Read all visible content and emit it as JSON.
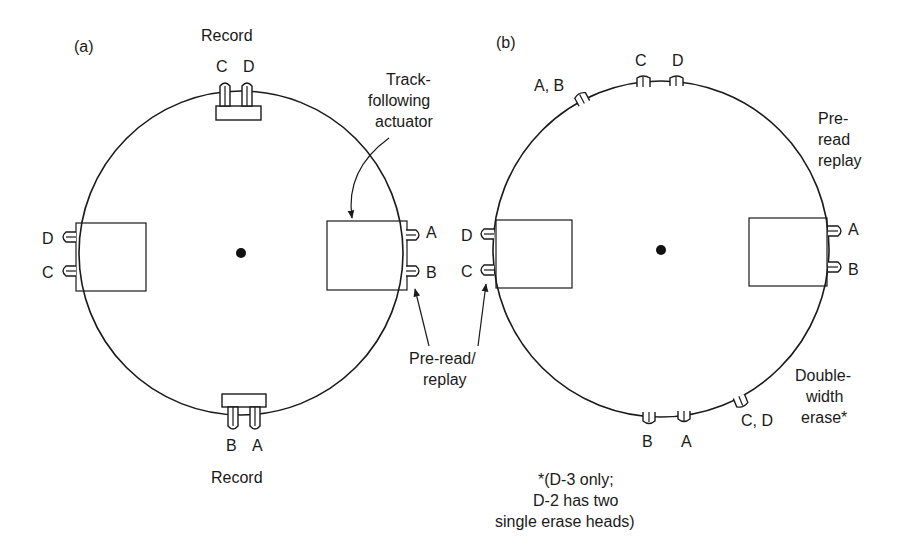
{
  "figure": {
    "panel_a": {
      "label": "(a)",
      "top_record_label": "Record",
      "top_heads": [
        "C",
        "D"
      ],
      "bottom_heads": [
        "B",
        "A"
      ],
      "bottom_record_label": "Record",
      "left_heads": [
        "D",
        "C"
      ],
      "right_heads": [
        "A",
        "B"
      ],
      "actuator_label": [
        "Track-",
        "following",
        "actuator"
      ],
      "preread_label": [
        "Pre-read/",
        "replay"
      ]
    },
    "panel_b": {
      "label": "(b)",
      "top_heads": [
        "C",
        "D"
      ],
      "ab_erase_label": "A, B",
      "preread_label": [
        "Pre-",
        "read",
        "replay"
      ],
      "left_heads": [
        "D",
        "C"
      ],
      "right_heads": [
        "A",
        "B"
      ],
      "bottom_heads": [
        "B",
        "A"
      ],
      "cd_erase_label": "C, D",
      "double_width_label": [
        "Double-",
        "width",
        "erase*"
      ],
      "footnote": [
        "*(D-3 only;",
        "D-2 has two",
        "single erase heads)"
      ]
    },
    "colors": {
      "ink": "#1a1a1a",
      "background": "#ffffff"
    }
  }
}
